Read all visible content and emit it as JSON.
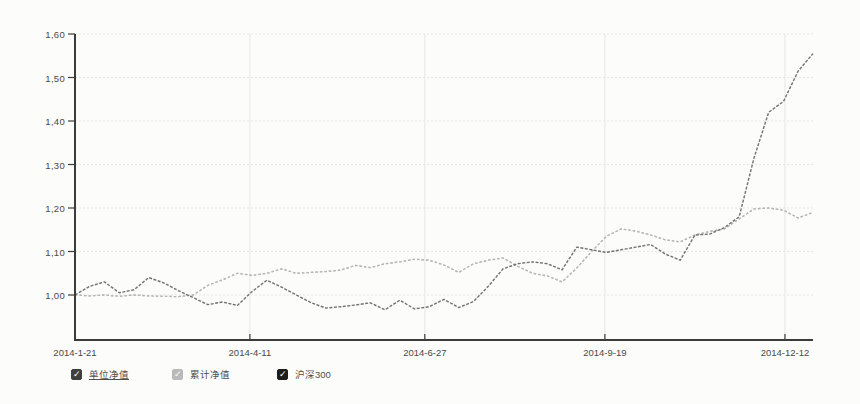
{
  "page": {
    "background": "#fcfcfa"
  },
  "chart_data": {
    "type": "line",
    "title": "",
    "xlabel": "",
    "ylabel": "",
    "grid": true,
    "legend_position": "bottom-left",
    "ylim": [
      0.9,
      1.62
    ],
    "y_tick_values": [
      1.0,
      1.1,
      1.2,
      1.3,
      1.4,
      1.5,
      1.6
    ],
    "y_tick_labels": [
      "1,00",
      "1,10",
      "1,20",
      "1,30",
      "1,40",
      "1,50",
      "1,60"
    ],
    "x_tick_labels": [
      "2014-1-21",
      "2014-4-11",
      "2014-6-27",
      "2014-9-19",
      "2014-12-12"
    ],
    "x_tick_fractions": [
      0,
      0.237,
      0.474,
      0.718,
      0.962
    ],
    "x_range_note": "weekly points from 2014-1-21 to ~2014-12-31",
    "axis_color": "#3b3b38",
    "grid_color": "#e6e6e2",
    "series": [
      {
        "id": "unit-nav",
        "name": "单位净值",
        "color": "#c8c8c5",
        "dash": "2.5 2",
        "width": 1.3,
        "values": [
          1.0,
          0.998,
          1.0,
          0.997,
          1.0,
          0.998,
          0.997,
          0.996,
          1.0,
          1.022,
          1.035,
          1.05,
          1.045,
          1.05,
          1.06,
          1.05,
          1.052,
          1.054,
          1.057,
          1.068,
          1.063,
          1.072,
          1.076,
          1.082,
          1.08,
          1.069,
          1.052,
          1.072,
          1.08,
          1.085,
          1.066,
          1.05,
          1.044,
          1.03,
          1.062,
          1.1,
          1.135,
          1.152,
          1.147,
          1.138,
          1.127,
          1.122,
          1.138,
          1.146,
          1.152,
          1.175,
          1.198,
          1.2,
          1.195,
          1.177,
          1.19
        ]
      },
      {
        "id": "cum-nav",
        "name": "累计净值",
        "color": "#b5b5b2",
        "dash": "2.5 2",
        "width": 1.3,
        "note": "identical to 单位净值 — the two light dashed lines overlap",
        "values": [
          1.0,
          0.998,
          1.0,
          0.997,
          1.0,
          0.998,
          0.997,
          0.996,
          1.0,
          1.022,
          1.035,
          1.05,
          1.045,
          1.05,
          1.06,
          1.05,
          1.052,
          1.054,
          1.057,
          1.068,
          1.063,
          1.072,
          1.076,
          1.082,
          1.08,
          1.069,
          1.052,
          1.072,
          1.08,
          1.085,
          1.066,
          1.05,
          1.044,
          1.03,
          1.062,
          1.1,
          1.135,
          1.152,
          1.147,
          1.138,
          1.127,
          1.122,
          1.138,
          1.146,
          1.152,
          1.175,
          1.198,
          1.2,
          1.195,
          1.177,
          1.19
        ]
      },
      {
        "id": "csi300",
        "name": "沪深300",
        "color": "#71716e",
        "dash": "3 1.5",
        "width": 1.4,
        "values": [
          1.0,
          1.02,
          1.03,
          1.005,
          1.012,
          1.04,
          1.028,
          1.01,
          0.994,
          0.978,
          0.984,
          0.976,
          1.008,
          1.034,
          1.018,
          1.0,
          0.982,
          0.97,
          0.973,
          0.977,
          0.982,
          0.966,
          0.988,
          0.968,
          0.973,
          0.99,
          0.971,
          0.985,
          1.02,
          1.06,
          1.072,
          1.076,
          1.072,
          1.058,
          1.11,
          1.104,
          1.098,
          1.104,
          1.11,
          1.116,
          1.094,
          1.08,
          1.138,
          1.14,
          1.155,
          1.18,
          1.315,
          1.42,
          1.445,
          1.515,
          1.555
        ]
      }
    ]
  },
  "legend": {
    "items": [
      {
        "label": "单位净值",
        "checked": true,
        "box_color": "#3f3f3d",
        "check_color": "#ffffff",
        "underline": true
      },
      {
        "label": "累计净值",
        "checked": true,
        "box_color": "#bababa",
        "check_color": "#ffffff",
        "underline": false
      },
      {
        "label": "沪深300",
        "checked": true,
        "box_color": "#1d1d1b",
        "check_color": "#ffffff",
        "underline": false
      }
    ],
    "check_glyph": "✓"
  }
}
